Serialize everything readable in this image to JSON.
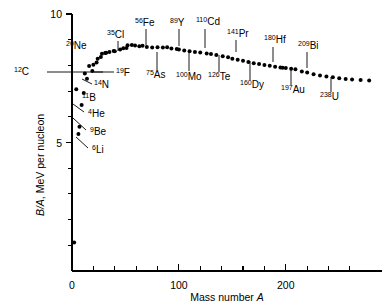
{
  "chart_data": {
    "type": "scatter",
    "title": "",
    "xlabel": "Mass number A",
    "ylabel": "B/A, MeV per nucleon",
    "xlim": [
      0,
      290
    ],
    "ylim": [
      0,
      10
    ],
    "grid": false,
    "legend": null,
    "x_ticks_major": [
      0,
      100,
      200
    ],
    "x_tick_labels": [
      "0",
      "100",
      "200"
    ],
    "x_ticks_minor": [
      20,
      40,
      60,
      80,
      120,
      140,
      160,
      180,
      220,
      240,
      260
    ],
    "y_ticks_major": [
      5,
      10
    ],
    "y_tick_labels": [
      "5",
      "10"
    ],
    "y_ticks_minor": [
      1,
      2,
      3,
      4,
      6,
      7,
      8,
      9
    ],
    "points": [
      {
        "A": 2,
        "BA": 1.11
      },
      {
        "A": 4,
        "BA": 7.07
      },
      {
        "A": 6,
        "BA": 5.33
      },
      {
        "A": 7,
        "BA": 5.61
      },
      {
        "A": 9,
        "BA": 6.46
      },
      {
        "A": 11,
        "BA": 6.93
      },
      {
        "A": 12,
        "BA": 7.68
      },
      {
        "A": 14,
        "BA": 7.48
      },
      {
        "A": 16,
        "BA": 7.98
      },
      {
        "A": 19,
        "BA": 7.78
      },
      {
        "A": 20,
        "BA": 8.03
      },
      {
        "A": 23,
        "BA": 8.11
      },
      {
        "A": 24,
        "BA": 8.26
      },
      {
        "A": 27,
        "BA": 8.33
      },
      {
        "A": 28,
        "BA": 8.45
      },
      {
        "A": 31,
        "BA": 8.48
      },
      {
        "A": 32,
        "BA": 8.49
      },
      {
        "A": 35,
        "BA": 8.52
      },
      {
        "A": 39,
        "BA": 8.56
      },
      {
        "A": 40,
        "BA": 8.55
      },
      {
        "A": 45,
        "BA": 8.62
      },
      {
        "A": 48,
        "BA": 8.67
      },
      {
        "A": 51,
        "BA": 8.68
      },
      {
        "A": 52,
        "BA": 8.78
      },
      {
        "A": 56,
        "BA": 8.79
      },
      {
        "A": 59,
        "BA": 8.77
      },
      {
        "A": 63,
        "BA": 8.75
      },
      {
        "A": 66,
        "BA": 8.76
      },
      {
        "A": 70,
        "BA": 8.72
      },
      {
        "A": 75,
        "BA": 8.7
      },
      {
        "A": 80,
        "BA": 8.71
      },
      {
        "A": 85,
        "BA": 8.7
      },
      {
        "A": 89,
        "BA": 8.71
      },
      {
        "A": 93,
        "BA": 8.66
      },
      {
        "A": 98,
        "BA": 8.64
      },
      {
        "A": 100,
        "BA": 8.62
      },
      {
        "A": 105,
        "BA": 8.58
      },
      {
        "A": 110,
        "BA": 8.55
      },
      {
        "A": 115,
        "BA": 8.52
      },
      {
        "A": 120,
        "BA": 8.5
      },
      {
        "A": 126,
        "BA": 8.46
      },
      {
        "A": 130,
        "BA": 8.44
      },
      {
        "A": 135,
        "BA": 8.4
      },
      {
        "A": 141,
        "BA": 8.36
      },
      {
        "A": 146,
        "BA": 8.32
      },
      {
        "A": 150,
        "BA": 8.26
      },
      {
        "A": 155,
        "BA": 8.22
      },
      {
        "A": 160,
        "BA": 8.18
      },
      {
        "A": 165,
        "BA": 8.13
      },
      {
        "A": 170,
        "BA": 8.08
      },
      {
        "A": 175,
        "BA": 8.05
      },
      {
        "A": 180,
        "BA": 8.02
      },
      {
        "A": 185,
        "BA": 7.99
      },
      {
        "A": 190,
        "BA": 7.95
      },
      {
        "A": 195,
        "BA": 7.92
      },
      {
        "A": 197,
        "BA": 7.91
      },
      {
        "A": 200,
        "BA": 7.9
      },
      {
        "A": 205,
        "BA": 7.87
      },
      {
        "A": 209,
        "BA": 7.85
      },
      {
        "A": 215,
        "BA": 7.76
      },
      {
        "A": 220,
        "BA": 7.72
      },
      {
        "A": 226,
        "BA": 7.66
      },
      {
        "A": 232,
        "BA": 7.61
      },
      {
        "A": 238,
        "BA": 7.57
      },
      {
        "A": 244,
        "BA": 7.54
      },
      {
        "A": 250,
        "BA": 7.5
      },
      {
        "A": 256,
        "BA": 7.47
      },
      {
        "A": 262,
        "BA": 7.45
      },
      {
        "A": 270,
        "BA": 7.43
      },
      {
        "A": 278,
        "BA": 7.41
      }
    ],
    "annotations": [
      {
        "mass": "12",
        "symbol": "C",
        "A": 12,
        "BA": 7.68,
        "text_x": 14,
        "text_y": 75,
        "leader": [
          [
            47,
            72
          ],
          [
            103,
            72
          ]
        ],
        "side": "left"
      },
      {
        "mass": "6",
        "symbol": "Li",
        "A": 6,
        "BA": 5.33,
        "text_x": 92,
        "text_y": 153,
        "leader": [
          [
            88,
            148
          ],
          [
            76,
            137
          ]
        ],
        "side": "below-right"
      },
      {
        "mass": "9",
        "symbol": "Be",
        "A": 9,
        "BA": 6.46,
        "text_x": 90,
        "text_y": 135,
        "leader": [
          [
            86,
            130
          ],
          [
            73,
            118
          ]
        ],
        "side": "below-right"
      },
      {
        "mass": "4",
        "symbol": "He",
        "A": 4,
        "BA": 7.07,
        "text_x": 88,
        "text_y": 117,
        "leader": [
          [
            84,
            112
          ],
          [
            73,
            104
          ]
        ],
        "side": "below-right"
      },
      {
        "mass": "11",
        "symbol": "B",
        "A": 11,
        "BA": 6.93,
        "text_x": 82,
        "text_y": 101,
        "leader": null,
        "side": "right"
      },
      {
        "mass": "14",
        "symbol": "N",
        "A": 14,
        "BA": 7.48,
        "text_x": 94,
        "text_y": 88,
        "leader": [
          [
            92,
            84
          ],
          [
            82,
            79
          ]
        ],
        "side": "below-right"
      },
      {
        "mass": "20",
        "symbol": "Ne",
        "A": 20,
        "BA": 8.03,
        "text_x": 66,
        "text_y": 49,
        "leader": null,
        "side": "above-left"
      },
      {
        "mass": "19",
        "symbol": "F",
        "A": 19,
        "BA": 7.78,
        "text_x": 116,
        "text_y": 76,
        "leader": [
          [
            114,
            72
          ],
          [
            94,
            72
          ]
        ],
        "side": "below"
      },
      {
        "mass": "35",
        "symbol": "Cl",
        "A": 35,
        "BA": 8.52,
        "text_x": 107,
        "text_y": 38,
        "leader": [
          [
            118,
            41
          ],
          [
            118,
            51
          ]
        ],
        "side": "above"
      },
      {
        "mass": "56",
        "symbol": "Fe",
        "A": 56,
        "BA": 8.79,
        "text_x": 135,
        "text_y": 26,
        "leader": [
          [
            146,
            29
          ],
          [
            146,
            45
          ]
        ],
        "side": "above"
      },
      {
        "mass": "75",
        "symbol": "As",
        "A": 75,
        "BA": 8.7,
        "text_x": 146,
        "text_y": 78,
        "leader": [
          [
            157,
            70
          ],
          [
            157,
            52
          ]
        ],
        "side": "below"
      },
      {
        "mass": "89",
        "symbol": "Y",
        "A": 89,
        "BA": 8.71,
        "text_x": 170,
        "text_y": 26,
        "leader": [
          [
            179,
            29
          ],
          [
            179,
            46
          ]
        ],
        "side": "above"
      },
      {
        "mass": "100",
        "symbol": "Mo",
        "A": 100,
        "BA": 8.62,
        "text_x": 176,
        "text_y": 80,
        "leader": [
          [
            189,
            71
          ],
          [
            189,
            53
          ]
        ],
        "side": "below"
      },
      {
        "mass": "110",
        "symbol": "Cd",
        "A": 110,
        "BA": 8.55,
        "text_x": 196,
        "text_y": 25,
        "leader": [
          [
            205,
            29
          ],
          [
            205,
            48
          ]
        ],
        "side": "above"
      },
      {
        "mass": "126",
        "symbol": "Te",
        "A": 126,
        "BA": 8.46,
        "text_x": 208,
        "text_y": 80,
        "leader": [
          [
            219,
            72
          ],
          [
            219,
            55
          ]
        ],
        "side": "below"
      },
      {
        "mass": "141",
        "symbol": "Pr",
        "A": 141,
        "BA": 8.36,
        "text_x": 227,
        "text_y": 37,
        "leader": [
          [
            236,
            40
          ],
          [
            236,
            52
          ]
        ],
        "side": "above"
      },
      {
        "mass": "160",
        "symbol": "Dy",
        "A": 160,
        "BA": 8.18,
        "text_x": 240,
        "text_y": 88,
        "leader": [
          [
            250,
            80
          ],
          [
            250,
            61
          ]
        ],
        "side": "below"
      },
      {
        "mass": "180",
        "symbol": "Hf",
        "A": 180,
        "BA": 8.02,
        "text_x": 264,
        "text_y": 43,
        "leader": [
          [
            273,
            47
          ],
          [
            273,
            62
          ]
        ],
        "side": "above"
      },
      {
        "mass": "197",
        "symbol": "Au",
        "A": 197,
        "BA": 7.91,
        "text_x": 281,
        "text_y": 93,
        "leader": [
          [
            291,
            85
          ],
          [
            291,
            68
          ]
        ],
        "side": "below"
      },
      {
        "mass": "209",
        "symbol": "Bi",
        "A": 209,
        "BA": 7.85,
        "text_x": 298,
        "text_y": 49,
        "leader": [
          [
            307,
            52
          ],
          [
            307,
            68
          ]
        ],
        "side": "above"
      },
      {
        "mass": "238",
        "symbol": "U",
        "A": 238,
        "BA": 7.57,
        "text_x": 320,
        "text_y": 100,
        "leader": [
          [
            331,
            92
          ],
          [
            331,
            77
          ]
        ],
        "side": "below"
      }
    ]
  },
  "axes": {
    "y_label_main": "B/A",
    "y_label_rest": ", MeV per nucleon",
    "x_label_main": "Mass number ",
    "x_label_italic": "A"
  }
}
